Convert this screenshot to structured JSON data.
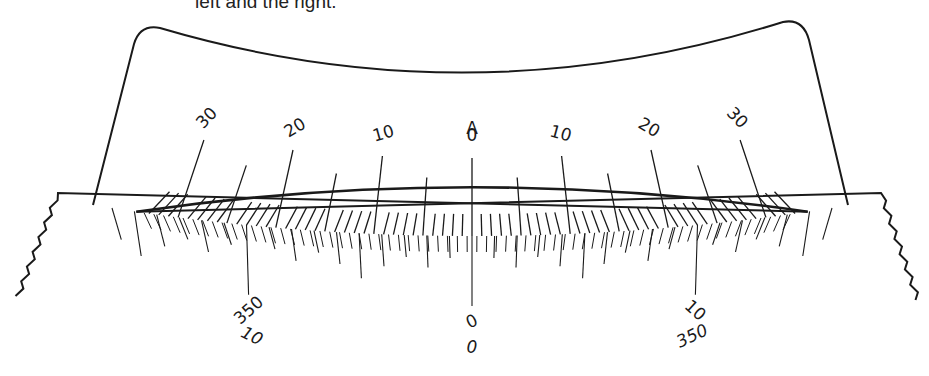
{
  "caption": "left and the right.",
  "diagram": {
    "type": "vernier-scale",
    "index_label": "A",
    "colors": {
      "ink": "#1a1a1a",
      "background": "#ffffff"
    },
    "geometry": {
      "center_x": 472,
      "center_y": -2096,
      "radius": 2332,
      "degrees_per_main_unit": 0.2413,
      "vernier_units_span": 10,
      "vernier_main_units_equiv": 23
    },
    "main_scale": {
      "range": [
        -33,
        33
      ],
      "major_every": 10,
      "mid_every": 5,
      "labels": [
        {
          "value": -30,
          "text": "30"
        },
        {
          "value": -20,
          "text": "20"
        },
        {
          "value": -10,
          "text": "10"
        },
        {
          "value": 0,
          "text": "0"
        },
        {
          "value": 10,
          "text": "10"
        },
        {
          "value": 20,
          "text": "20"
        },
        {
          "value": 30,
          "text": "30"
        }
      ]
    },
    "vernier_scale": {
      "range": [
        -16,
        16
      ],
      "labels": [
        {
          "value": -10,
          "upper": "10",
          "lower": "350"
        },
        {
          "value": 0,
          "upper": "0",
          "lower": "0"
        },
        {
          "value": 10,
          "upper": "350",
          "lower": "10"
        }
      ]
    }
  }
}
